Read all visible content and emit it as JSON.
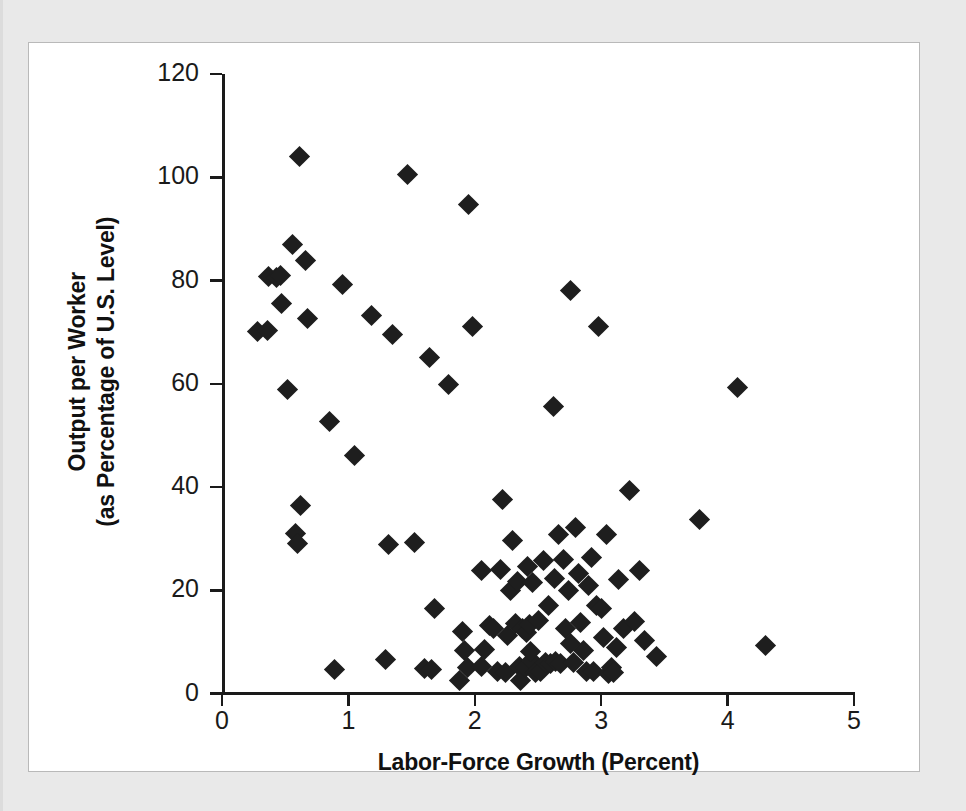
{
  "figure": {
    "background_color": "#e9e9e9",
    "card_color": "#ffffff",
    "marker_color": "#1e1e1e",
    "axis_color": "#1a1a1a"
  },
  "chart_data": {
    "type": "scatter",
    "title": "",
    "xlabel": "Labor-Force Growth (Percent)",
    "ylabel": "Output per Worker\n(as Percentage of U.S. Level)",
    "ylabel_line1": "Output per Worker",
    "ylabel_line2": "(as Percentage of U.S. Level)",
    "xlim": [
      0,
      5
    ],
    "ylim": [
      0,
      120
    ],
    "xticks": [
      0,
      1,
      2,
      3,
      4,
      5
    ],
    "xtick_labels": [
      "0",
      "1",
      "2",
      "3",
      "4",
      "5"
    ],
    "yticks": [
      0,
      20,
      40,
      60,
      80,
      100,
      120
    ],
    "ytick_labels": [
      "0",
      "20",
      "40",
      "60",
      "80",
      "100",
      "120"
    ],
    "grid": false,
    "legend": null,
    "marker": "diamond",
    "n_points": 104,
    "points": [
      [
        0.28,
        70.2
      ],
      [
        0.36,
        70.3
      ],
      [
        0.37,
        80.8
      ],
      [
        0.43,
        80.5
      ],
      [
        0.46,
        81.0
      ],
      [
        0.47,
        75.5
      ],
      [
        0.52,
        58.8
      ],
      [
        0.56,
        87.0
      ],
      [
        0.58,
        31.0
      ],
      [
        0.6,
        29.0
      ],
      [
        0.61,
        104.0
      ],
      [
        0.62,
        36.4
      ],
      [
        0.66,
        83.8
      ],
      [
        0.68,
        72.7
      ],
      [
        0.85,
        52.7
      ],
      [
        0.89,
        4.6
      ],
      [
        0.95,
        79.3
      ],
      [
        1.05,
        46.1
      ],
      [
        1.18,
        73.3
      ],
      [
        1.29,
        6.5
      ],
      [
        1.32,
        28.8
      ],
      [
        1.35,
        69.5
      ],
      [
        1.47,
        100.6
      ],
      [
        1.52,
        29.2
      ],
      [
        1.6,
        4.8
      ],
      [
        1.64,
        65.0
      ],
      [
        1.66,
        4.6
      ],
      [
        1.68,
        16.5
      ],
      [
        1.79,
        59.8
      ],
      [
        1.88,
        2.5
      ],
      [
        1.9,
        12.0
      ],
      [
        1.92,
        8.3
      ],
      [
        1.94,
        5.0
      ],
      [
        1.95,
        94.8
      ],
      [
        1.98,
        71.0
      ],
      [
        2.05,
        5.2
      ],
      [
        2.08,
        8.6
      ],
      [
        2.12,
        13.2
      ],
      [
        2.15,
        12.5
      ],
      [
        2.18,
        4.3
      ],
      [
        2.2,
        24.0
      ],
      [
        2.22,
        37.6
      ],
      [
        2.24,
        4.1
      ],
      [
        2.26,
        11.3
      ],
      [
        2.28,
        20.0
      ],
      [
        2.3,
        29.6
      ],
      [
        2.32,
        13.5
      ],
      [
        2.34,
        21.6
      ],
      [
        2.35,
        5.3
      ],
      [
        2.36,
        2.6
      ],
      [
        2.38,
        12.6
      ],
      [
        2.4,
        5.1
      ],
      [
        2.41,
        11.8
      ],
      [
        2.42,
        24.6
      ],
      [
        2.43,
        13.4
      ],
      [
        2.45,
        6.3
      ],
      [
        2.46,
        21.5
      ],
      [
        2.48,
        4.0
      ],
      [
        2.5,
        14.1
      ],
      [
        2.52,
        4.2
      ],
      [
        2.54,
        25.8
      ],
      [
        2.56,
        6.0
      ],
      [
        2.58,
        17.0
      ],
      [
        2.6,
        5.9
      ],
      [
        2.62,
        55.5
      ],
      [
        2.63,
        22.2
      ],
      [
        2.64,
        6.2
      ],
      [
        2.66,
        30.8
      ],
      [
        2.68,
        5.8
      ],
      [
        2.7,
        26.0
      ],
      [
        2.72,
        12.5
      ],
      [
        2.74,
        19.9
      ],
      [
        2.76,
        78.0
      ],
      [
        2.78,
        6.1
      ],
      [
        2.8,
        32.2
      ],
      [
        2.82,
        23.3
      ],
      [
        2.84,
        13.8
      ],
      [
        2.86,
        8.4
      ],
      [
        2.88,
        4.3
      ],
      [
        2.9,
        20.9
      ],
      [
        2.92,
        26.3
      ],
      [
        2.94,
        4.2
      ],
      [
        2.96,
        17.0
      ],
      [
        2.98,
        71.0
      ],
      [
        3.0,
        16.4
      ],
      [
        3.02,
        10.8
      ],
      [
        3.04,
        30.8
      ],
      [
        3.06,
        3.9
      ],
      [
        3.08,
        5.0
      ],
      [
        3.1,
        4.1
      ],
      [
        3.14,
        22.1
      ],
      [
        3.18,
        12.6
      ],
      [
        3.22,
        39.4
      ],
      [
        3.26,
        14.0
      ],
      [
        3.3,
        23.9
      ],
      [
        3.34,
        10.2
      ],
      [
        3.44,
        7.2
      ],
      [
        3.78,
        33.8
      ],
      [
        4.08,
        59.2
      ],
      [
        4.3,
        9.3
      ],
      [
        2.05,
        23.8
      ],
      [
        2.44,
        8.2
      ],
      [
        2.76,
        9.6
      ],
      [
        3.12,
        9.0
      ]
    ]
  }
}
